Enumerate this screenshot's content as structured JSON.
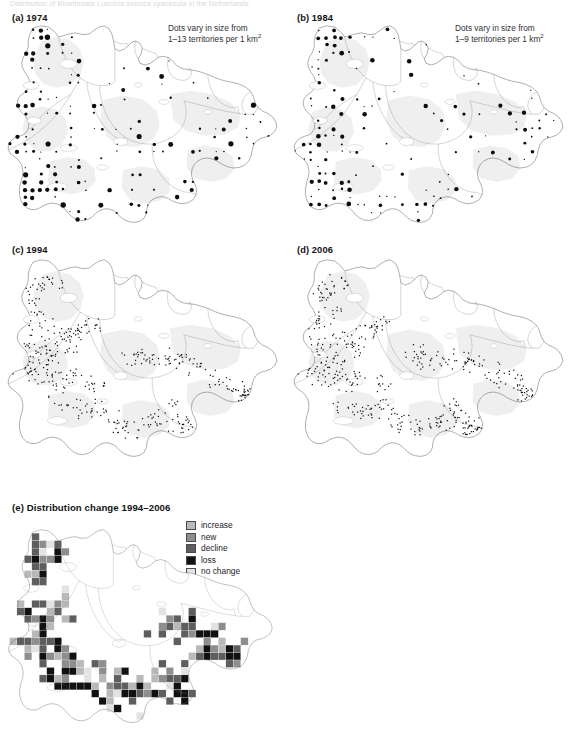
{
  "figure": {
    "caption": "Distribution of Bluethroats Luscinia svecica cyanecula in the Netherlands",
    "panels": [
      {
        "id": "a",
        "label": "(a) 1974",
        "year": "1974",
        "note_line1": "Dots vary in size from",
        "note_line2": "1–13 territories per 1 km",
        "note_sup": "2"
      },
      {
        "id": "b",
        "label": "(b) 1984",
        "year": "1984",
        "note_line1": "Dots vary in size from",
        "note_line2": "1–9 territories per 1 km",
        "note_sup": "2"
      },
      {
        "id": "c",
        "label": "(c) 1994",
        "year": "1994"
      },
      {
        "id": "d",
        "label": "(d) 2006",
        "year": "2006"
      },
      {
        "id": "e",
        "label": "(e) Distribution change 1994–2006",
        "year": "1994–2006"
      }
    ],
    "change_legend": [
      {
        "label": "increase",
        "color": "#b9b9b9"
      },
      {
        "label": "new",
        "color": "#8e8e8e"
      },
      {
        "label": "decline",
        "color": "#5e5e5e"
      },
      {
        "label": "loss",
        "color": "#111111"
      },
      {
        "label": "no change",
        "color": "#e3e3e3"
      }
    ]
  },
  "chart_data": {
    "type": "map",
    "title": "Distribution of Bluethroats Luscinia svecica cyanecula in the Netherlands",
    "subplots": [
      {
        "id": "a",
        "title": "(a) 1974",
        "annotation": "Dots vary in size from 1–13 territories per 1 km²",
        "symbol": "graduated dot",
        "value_range": [
          1,
          13
        ],
        "value_unit": "territories per 1 km²",
        "n_dots_approx": 74,
        "points": [
          [
            28,
            16,
            2
          ],
          [
            40,
            12,
            2
          ],
          [
            52,
            11,
            3
          ],
          [
            33,
            22,
            2
          ],
          [
            46,
            20,
            6
          ],
          [
            59,
            19,
            3
          ],
          [
            41,
            29,
            2
          ],
          [
            52,
            28,
            5
          ],
          [
            64,
            28,
            3
          ],
          [
            40,
            38,
            2
          ],
          [
            52,
            37,
            3
          ],
          [
            63,
            37,
            2
          ],
          [
            29,
            48,
            4
          ],
          [
            43,
            47,
            4
          ],
          [
            55,
            47,
            3
          ],
          [
            11,
            65,
            1
          ],
          [
            26,
            64,
            2
          ],
          [
            19,
            73,
            2
          ],
          [
            33,
            72,
            2
          ],
          [
            46,
            70,
            1
          ],
          [
            8,
            80,
            1
          ],
          [
            23,
            79,
            3
          ],
          [
            35,
            78,
            2
          ],
          [
            56,
            73,
            2
          ],
          [
            71,
            64,
            2
          ],
          [
            10,
            88,
            1
          ],
          [
            25,
            87,
            3
          ],
          [
            37,
            86,
            2
          ],
          [
            49,
            85,
            2
          ],
          [
            63,
            83,
            2
          ],
          [
            17,
            96,
            2
          ],
          [
            31,
            95,
            2
          ],
          [
            46,
            94,
            3
          ],
          [
            57,
            93,
            5
          ],
          [
            70,
            92,
            2
          ],
          [
            13,
            106,
            2
          ],
          [
            27,
            105,
            3
          ],
          [
            40,
            104,
            2
          ],
          [
            52,
            103,
            2
          ],
          [
            21,
            116,
            3
          ],
          [
            34,
            115,
            2
          ],
          [
            47,
            114,
            2
          ],
          [
            63,
            112,
            2
          ],
          [
            16,
            124,
            2
          ],
          [
            30,
            123,
            3
          ],
          [
            44,
            122,
            2
          ],
          [
            57,
            121,
            2
          ],
          [
            25,
            133,
            2
          ],
          [
            39,
            132,
            5
          ],
          [
            53,
            131,
            2
          ],
          [
            67,
            130,
            2
          ],
          [
            31,
            141,
            2
          ],
          [
            45,
            140,
            2
          ],
          [
            60,
            139,
            2
          ],
          [
            74,
            138,
            2
          ],
          [
            39,
            150,
            3
          ],
          [
            53,
            149,
            2
          ],
          [
            67,
            148,
            2
          ],
          [
            81,
            147,
            2
          ],
          [
            96,
            108,
            2
          ],
          [
            110,
            105,
            2
          ],
          [
            124,
            102,
            2
          ],
          [
            137,
            99,
            2
          ],
          [
            150,
            96,
            2
          ],
          [
            163,
            93,
            2
          ],
          [
            176,
            90,
            3
          ],
          [
            189,
            87,
            2
          ],
          [
            202,
            84,
            2
          ],
          [
            215,
            81,
            4
          ],
          [
            228,
            78,
            6
          ],
          [
            241,
            75,
            3
          ],
          [
            96,
            160,
            3
          ],
          [
            112,
            158,
            2
          ],
          [
            128,
            156,
            2
          ],
          [
            144,
            154,
            3
          ],
          [
            160,
            152,
            2
          ]
        ]
      },
      {
        "id": "b",
        "title": "(b) 1984",
        "annotation": "Dots vary in size from 1–9 territories per 1 km²",
        "symbol": "graduated dot",
        "value_range": [
          1,
          9
        ],
        "value_unit": "territories per 1 km²",
        "n_dots_approx": 68
      },
      {
        "id": "c",
        "title": "(c) 1994",
        "symbol": "uniform small dot (presence)",
        "n_dots_approx": 430
      },
      {
        "id": "d",
        "title": "(d) 2006",
        "symbol": "uniform small dot (presence)",
        "n_dots_approx": 470
      },
      {
        "id": "e",
        "title": "(e) Distribution change 1994–2006",
        "symbol": "grid cell fill",
        "categories": [
          "increase",
          "new",
          "decline",
          "loss",
          "no change"
        ],
        "colors": [
          "#b9b9b9",
          "#8e8e8e",
          "#5e5e5e",
          "#111111",
          "#e3e3e3"
        ]
      }
    ]
  }
}
